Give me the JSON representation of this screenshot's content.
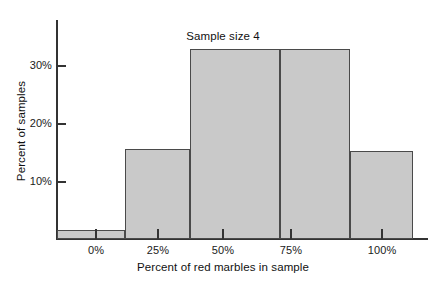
{
  "chart_data": {
    "type": "bar",
    "title": "Sample size 4",
    "xlabel": "Percent of red marbles in sample",
    "ylabel": "Percent of samples",
    "categories": [
      "0%",
      "25%",
      "50%",
      "75%",
      "100%"
    ],
    "values": [
      1.6,
      15.5,
      32.7,
      32.7,
      15.2
    ],
    "x_tick_labels": [
      "0%",
      "25%",
      "50%",
      "75%",
      "100%"
    ],
    "y_tick_labels": [
      "10%",
      "20%",
      "30%"
    ],
    "y_tick_values": [
      10,
      20,
      30
    ],
    "ylim": [
      0,
      37.8
    ],
    "xlim": [
      -12.5,
      112.5
    ],
    "grid": false,
    "legend": null,
    "bar_fill_color": "#c9c9c9",
    "bar_edge_color": "#4a4a4a",
    "axis_color": "#333333",
    "background_color": "#ffffff",
    "bars": [
      {
        "label": "0%",
        "value": 1.6,
        "left_px": 57,
        "width_px": 68
      },
      {
        "label": "25%",
        "value": 15.5,
        "left_px": 125,
        "width_px": 65
      },
      {
        "label": "50%",
        "value": 32.7,
        "left_px": 190,
        "width_px": 90
      },
      {
        "label": "75%",
        "value": 32.7,
        "left_px": 280,
        "width_px": 70
      },
      {
        "label": "100%",
        "value": 15.2,
        "left_px": 350,
        "width_px": 63
      }
    ],
    "x_ticks_px": [
      96,
      157,
      222,
      290,
      381
    ],
    "y_ticks_px": [
      181,
      123,
      65
    ]
  }
}
